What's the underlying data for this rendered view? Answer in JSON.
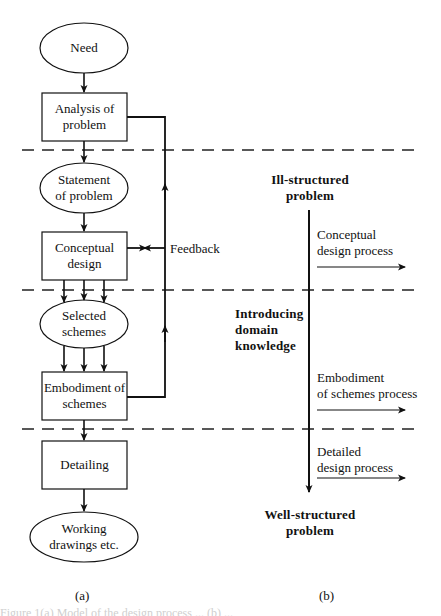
{
  "figure": {
    "panel_a": {
      "caption": "(a)",
      "nodes": [
        {
          "id": "need",
          "shape": "ellipse",
          "lines": [
            "Need"
          ]
        },
        {
          "id": "analysis",
          "shape": "box",
          "lines": [
            "Analysis of",
            "problem"
          ]
        },
        {
          "id": "statement",
          "shape": "ellipse",
          "lines": [
            "Statement",
            "of problem"
          ]
        },
        {
          "id": "conceptual",
          "shape": "box",
          "lines": [
            "Conceptual",
            "design"
          ]
        },
        {
          "id": "selected",
          "shape": "ellipse",
          "lines": [
            "Selected",
            "schemes"
          ]
        },
        {
          "id": "embodiment",
          "shape": "box",
          "lines": [
            "Embodiment of",
            "schemes"
          ]
        },
        {
          "id": "detailing",
          "shape": "box",
          "lines": [
            "Detailing"
          ]
        },
        {
          "id": "working",
          "shape": "ellipse",
          "lines": [
            "Working",
            "drawings etc."
          ]
        }
      ],
      "feedback_label": "Feedback"
    },
    "panel_b": {
      "caption": "(b)",
      "top_label": [
        "Ill-structured",
        "problem"
      ],
      "middle_label": [
        "Introducing",
        "domain",
        "knowledge"
      ],
      "bottom_label": [
        "Well-structured",
        "problem"
      ],
      "processes": [
        {
          "lines": [
            "Conceptual",
            "design process"
          ]
        },
        {
          "lines": [
            "Embodiment",
            "of schemes process"
          ]
        },
        {
          "lines": [
            "Detailed",
            "design process"
          ]
        }
      ]
    },
    "colors": {
      "ink": "#111111",
      "background": "#ffffff",
      "faint_text": "#cfcfcf"
    },
    "footer_partial": "Figure 1(a) Model of the design process ... (b) ..."
  }
}
